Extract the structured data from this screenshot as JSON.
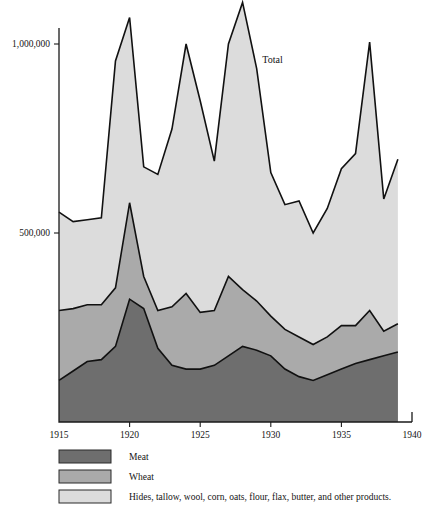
{
  "chart_data": {
    "type": "area",
    "title": "",
    "subtitle": "",
    "xlabel": "",
    "ylabel": "",
    "stacked": true,
    "grid": false,
    "legend_position": "bottom-left",
    "annotations": [
      {
        "text": "Total",
        "x": 1929.4,
        "y": 950000
      }
    ],
    "axis": {
      "x_range": [
        1915,
        1940
      ],
      "x_ticks": [
        1915,
        1920,
        1925,
        1930,
        1935,
        1940
      ],
      "x_tick_labels": [
        "1915",
        "1920",
        "1925",
        "1930",
        "1935",
        "1940"
      ],
      "y_range": [
        0,
        1150000
      ],
      "y_ticks": [
        500000,
        1000000
      ],
      "y_tick_labels": [
        "500,000",
        "1,000,000"
      ]
    },
    "x": [
      1915,
      1916,
      1917,
      1918,
      1919,
      1920,
      1921,
      1922,
      1923,
      1924,
      1925,
      1926,
      1927,
      1928,
      1929,
      1930,
      1931,
      1932,
      1933,
      1934,
      1935,
      1936,
      1937,
      1938,
      1939
    ],
    "series": [
      {
        "name": "Meat",
        "color": "#6e6e6e",
        "values": [
          110000,
          135000,
          160000,
          165000,
          200000,
          325000,
          300000,
          195000,
          150000,
          140000,
          140000,
          150000,
          175000,
          200000,
          190000,
          175000,
          140000,
          120000,
          110000,
          125000,
          140000,
          155000,
          165000,
          175000,
          185000
        ]
      },
      {
        "name": "Wheat",
        "color": "#aaaaaa",
        "values": [
          185000,
          165000,
          150000,
          145000,
          155000,
          255000,
          85000,
          100000,
          155000,
          200000,
          150000,
          145000,
          210000,
          150000,
          130000,
          105000,
          105000,
          105000,
          95000,
          100000,
          115000,
          100000,
          130000,
          65000,
          75000
        ]
      },
      {
        "name": "Hides, tallow, wool, corn, oats, flour, flax, butter, and other products.",
        "color": "#dcdcdc",
        "values": [
          260000,
          230000,
          225000,
          230000,
          600000,
          490000,
          290000,
          360000,
          470000,
          660000,
          560000,
          395000,
          615000,
          760000,
          615000,
          380000,
          330000,
          360000,
          295000,
          340000,
          415000,
          455000,
          710000,
          350000,
          435000
        ]
      }
    ],
    "totals": [
      555000,
      530000,
      535000,
      540000,
      955000,
      1070000,
      675000,
      655000,
      775000,
      1000000,
      850000,
      690000,
      1000000,
      1110000,
      935000,
      660000,
      575000,
      585000,
      500000,
      565000,
      670000,
      710000,
      1005000,
      590000,
      695000
    ]
  },
  "legend": {
    "items": [
      {
        "label": "Meat",
        "color": "#6e6e6e"
      },
      {
        "label": "Wheat",
        "color": "#aaaaaa"
      },
      {
        "label": "Hides, tallow, wool, corn, oats, flour, flax, butter, and other products.",
        "color": "#dcdcdc"
      }
    ]
  }
}
